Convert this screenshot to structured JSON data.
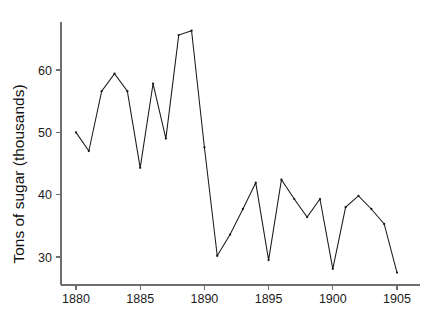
{
  "chart_data": {
    "type": "line",
    "title": "",
    "subtitle": "",
    "xlabel": "",
    "ylabel": "Tons of sugar (thousands)",
    "x": [
      1880,
      1881,
      1882,
      1883,
      1884,
      1885,
      1886,
      1887,
      1888,
      1889,
      1890,
      1891,
      1892,
      1893,
      1894,
      1895,
      1896,
      1897,
      1898,
      1899,
      1900,
      1901,
      1902,
      1903,
      1904,
      1905
    ],
    "values": [
      50.0,
      47.0,
      56.6,
      59.4,
      56.6,
      44.3,
      57.8,
      49.0,
      65.6,
      66.3,
      47.6,
      30.2,
      33.6,
      37.7,
      41.9,
      29.5,
      42.4,
      39.3,
      36.4,
      39.3,
      28.1,
      38.0,
      39.8,
      37.7,
      35.3,
      27.5
    ],
    "series": [
      {
        "name": "Tons of sugar (thousands)",
        "values": [
          50.0,
          47.0,
          56.6,
          59.4,
          56.6,
          44.3,
          57.8,
          49.0,
          65.6,
          66.3,
          47.6,
          30.2,
          33.6,
          37.7,
          41.9,
          29.5,
          42.4,
          39.3,
          36.4,
          39.3,
          28.1,
          38.0,
          39.8,
          37.7,
          35.3,
          27.5
        ],
        "color": "#1a1a1a"
      }
    ],
    "xlim": [
      1878.6,
      1906.4
    ],
    "ylim": [
      26.2,
      68.4
    ],
    "xticks": [
      1880,
      1885,
      1890,
      1895,
      1900,
      1905
    ],
    "xticklabels": [
      "1880",
      "1885",
      "1890",
      "1895",
      "1900",
      "1905"
    ],
    "yticks": [
      30,
      40,
      50,
      60
    ],
    "yticklabels": [
      "30",
      "40",
      "50",
      "60"
    ],
    "grid": false,
    "legend": false,
    "legend_position": "none",
    "line_color": "#1a1a1a",
    "axis_color": "#6e6e6e",
    "background_color": "#ffffff",
    "markers": true
  },
  "axes": {
    "y_axis_title": "Tons of sugar (thousands)"
  }
}
